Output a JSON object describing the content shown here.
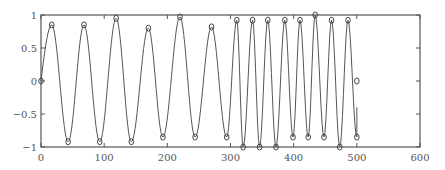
{
  "chart_data": {
    "type": "line",
    "title": "",
    "xlabel": "",
    "ylabel": "",
    "xlim": [
      0,
      600
    ],
    "ylim": [
      -1,
      1
    ],
    "grid": false,
    "legend": null,
    "x_ticks": [
      "0",
      "100",
      "200",
      "300",
      "400",
      "500",
      "600"
    ],
    "y_ticks": [
      "1",
      "0.5",
      "0",
      "−0.5",
      "−1"
    ],
    "series": [
      {
        "name": "signal",
        "style": "line",
        "color": "#555555",
        "description": "oscillating sinusoid; period ~50 for x in 0-300, period ~25 for x in 300-500",
        "x": [
          0,
          17,
          43,
          68,
          93,
          119,
          143,
          170,
          193,
          220,
          244,
          270,
          294,
          310,
          320,
          335,
          346,
          359,
          372,
          386,
          399,
          410,
          423,
          434,
          448,
          460,
          473,
          486,
          500,
          500
        ],
        "y": [
          0,
          0.85,
          -0.92,
          0.85,
          -0.92,
          0.95,
          -0.92,
          0.8,
          -0.85,
          0.97,
          -0.85,
          0.82,
          -0.85,
          0.92,
          -1.0,
          0.92,
          -1.0,
          0.92,
          -1.0,
          0.92,
          -0.85,
          0.92,
          -0.85,
          1.0,
          -0.85,
          0.92,
          -1.0,
          0.92,
          -0.85,
          -0.4
        ]
      },
      {
        "name": "extrema markers",
        "style": "markers",
        "marker": "open-circle",
        "color": "#555555",
        "x": [
          0,
          17,
          43,
          68,
          93,
          119,
          143,
          170,
          193,
          220,
          244,
          270,
          294,
          310,
          320,
          335,
          346,
          359,
          372,
          386,
          399,
          410,
          423,
          434,
          448,
          460,
          473,
          486,
          500,
          500
        ],
        "y": [
          0,
          0.85,
          -0.92,
          0.85,
          -0.92,
          0.95,
          -0.92,
          0.8,
          -0.85,
          0.97,
          -0.85,
          0.82,
          -0.85,
          0.92,
          -1.0,
          0.92,
          -1.0,
          0.92,
          -1.0,
          0.92,
          -0.85,
          0.92,
          -0.85,
          1.0,
          -0.85,
          0.92,
          -1.0,
          0.92,
          -0.85,
          0
        ]
      }
    ],
    "plot_area_px": {
      "left": 41,
      "right": 420,
      "top": 15,
      "bottom": 147
    }
  }
}
